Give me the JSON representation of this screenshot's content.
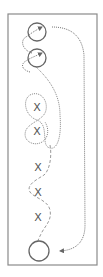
{
  "diagram": {
    "type": "drill-path",
    "frame": {
      "x": 8,
      "y": 14,
      "width": 89,
      "height": 251,
      "stroke": "#8a8a8a"
    },
    "colors": {
      "line": "#6f6f6f",
      "dashed": "#9a9a9a",
      "marker": "#555555"
    },
    "circles": [
      {
        "label": "start-circle-1",
        "cx": 37,
        "cy": 32,
        "r": 9
      },
      {
        "label": "start-circle-2",
        "cx": 37,
        "cy": 58,
        "r": 9
      },
      {
        "label": "end-circle",
        "cx": 39,
        "cy": 251,
        "r": 10
      }
    ],
    "markers": [
      {
        "glyph": "X",
        "x": 37,
        "y": 107
      },
      {
        "glyph": "X",
        "x": 37,
        "y": 131
      },
      {
        "glyph": "X",
        "x": 38,
        "y": 167
      },
      {
        "glyph": "X",
        "x": 38,
        "y": 192
      },
      {
        "glyph": "X",
        "x": 38,
        "y": 217
      }
    ]
  }
}
